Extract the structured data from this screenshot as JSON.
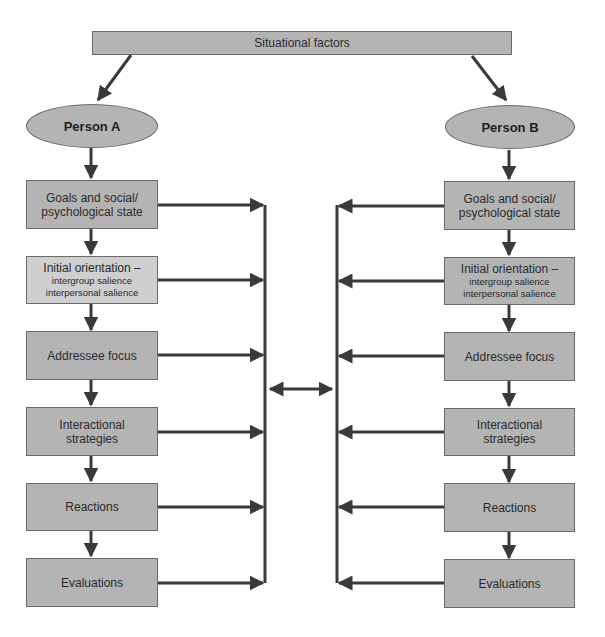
{
  "diagram": {
    "top": {
      "label": "Situational factors"
    },
    "person_a": {
      "label": "Person A",
      "boxes": [
        {
          "title": "Goals and social/",
          "title2": "psychological state"
        },
        {
          "title": "Initial orientation –",
          "sub1": "intergroup salience",
          "sub2": "interpersonal salience"
        },
        {
          "title": "Addressee focus"
        },
        {
          "title": "Interactional",
          "title2": "strategies"
        },
        {
          "title": "Reactions"
        },
        {
          "title": "Evaluations"
        }
      ]
    },
    "person_b": {
      "label": "Person B",
      "boxes": [
        {
          "title": "Goals and social/",
          "title2": "psychological state"
        },
        {
          "title": "Initial orientation –",
          "sub1": "intergroup salience",
          "sub2": "interpersonal salience"
        },
        {
          "title": "Addressee focus"
        },
        {
          "title": "Interactional",
          "title2": "strategies"
        },
        {
          "title": "Reactions"
        },
        {
          "title": "Evaluations"
        }
      ]
    },
    "colors": {
      "box_fill": "#b4b4b4",
      "box_fill_light": "#cfcfcf",
      "border": "#6a6a6a",
      "arrow": "#3a3a3a"
    }
  }
}
